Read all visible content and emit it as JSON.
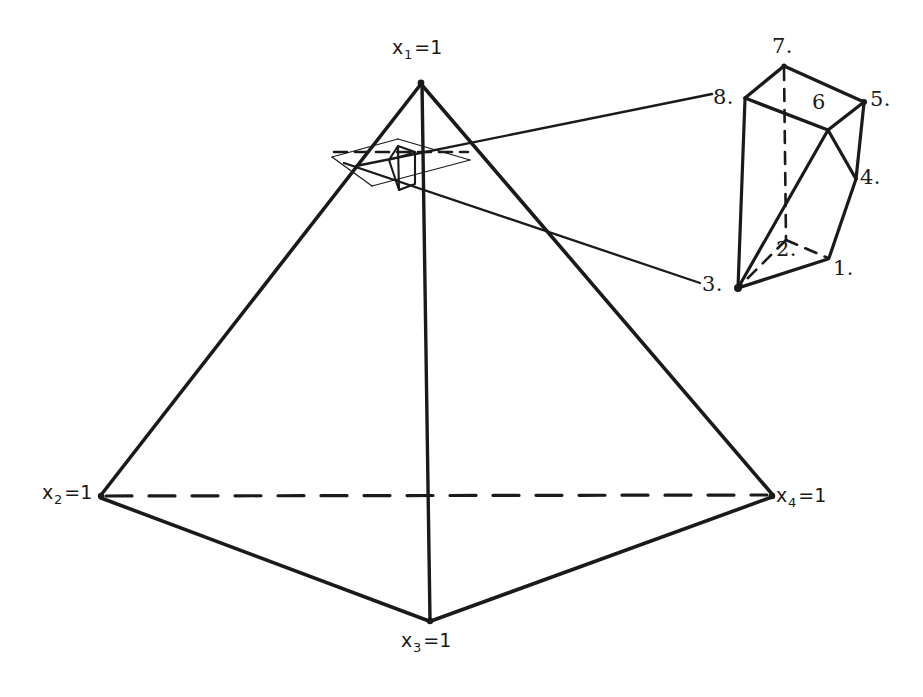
{
  "figure": {
    "kind": "line-diagram",
    "ink_color": "#1a1a1a",
    "background_color": "#ffffff"
  },
  "tetrahedron": {
    "vertices": [
      {
        "id": "apex",
        "label_var": "x",
        "label_sub": "1",
        "label_eq": "=1",
        "label_text": "x1=1",
        "x": 421,
        "y": 82
      },
      {
        "id": "left",
        "label_var": "x",
        "label_sub": "2",
        "label_eq": "=1",
        "label_text": "x2=1",
        "x": 100,
        "y": 497
      },
      {
        "id": "front",
        "label_var": "x",
        "label_sub": "3",
        "label_eq": "=1",
        "label_text": "x3=1",
        "x": 430,
        "y": 622
      },
      {
        "id": "right",
        "label_var": "x",
        "label_sub": "4",
        "label_eq": "=1",
        "label_text": "x4=1",
        "x": 773,
        "y": 496
      }
    ],
    "hidden_edge_note": "edge from x2=1 to x4=1 is drawn dashed (hidden behind the solid)"
  },
  "labels": {
    "apex": {
      "var": "x",
      "sub": "1",
      "eq": "=1"
    },
    "left": {
      "var": "x",
      "sub": "2",
      "eq": "=1"
    },
    "front": {
      "var": "x",
      "sub": "3",
      "eq": "=1"
    },
    "right": {
      "var": "x",
      "sub": "4",
      "eq": "=1"
    }
  },
  "inset": {
    "title_note": "magnified view of the small polytope near the apex",
    "vertex_labels": [
      {
        "id": "v1",
        "text": "1.",
        "x": 833,
        "y": 268
      },
      {
        "id": "v2",
        "text": "2.",
        "x": 778,
        "y": 249
      },
      {
        "id": "v3",
        "text": "3.",
        "x": 706,
        "y": 285
      },
      {
        "id": "v4",
        "text": "4.",
        "x": 862,
        "y": 178
      },
      {
        "id": "v5",
        "text": "5.",
        "x": 872,
        "y": 100
      },
      {
        "id": "v6",
        "text": "6",
        "x": 818,
        "y": 103
      },
      {
        "id": "v7",
        "text": "7.",
        "x": 780,
        "y": 48
      },
      {
        "id": "v8",
        "text": "8.",
        "x": 718,
        "y": 98
      }
    ],
    "leader_lines": [
      {
        "from": "small-polytope-upper-left",
        "to": "inset-vertex-8"
      },
      {
        "from": "small-polytope-lower-right",
        "to": "inset-vertex-3"
      }
    ]
  }
}
